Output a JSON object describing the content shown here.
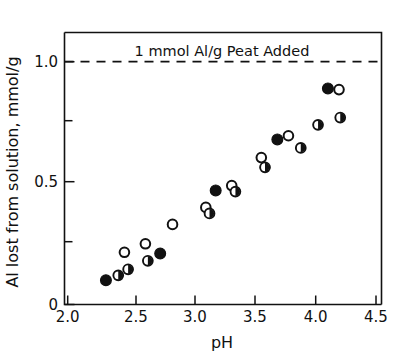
{
  "chart_data": {
    "type": "scatter",
    "title": "",
    "xlabel": "pH",
    "ylabel": "Al lost from solution, mmol/g",
    "xlim": [
      2.0,
      4.5
    ],
    "ylim": [
      0.0,
      1.08
    ],
    "grid": false,
    "legend": "none",
    "xticks": [
      "2.0",
      "2.5",
      "3.0",
      "3.5",
      "4.0",
      "4.5"
    ],
    "xtick_values": [
      2.0,
      2.5,
      3.0,
      3.5,
      4.0,
      4.5
    ],
    "yticks": [
      "0",
      "0.5",
      "1.0"
    ],
    "ytick_values": [
      0,
      0.5,
      1.0
    ],
    "yminor_values": [
      0.25,
      0.75
    ],
    "annotations": [
      {
        "text": "1 mmol Al/g Peat Added",
        "x": 3.25,
        "y": 1.0,
        "type": "reference-line-label"
      }
    ],
    "reference_lines": [
      {
        "orientation": "horizontal",
        "value": 1.0,
        "style": "dashed"
      }
    ],
    "series": [
      {
        "name": "filled-circle",
        "marker": "filled-circle",
        "points": [
          {
            "x": 2.31,
            "y": 0.1
          },
          {
            "x": 2.75,
            "y": 0.21
          },
          {
            "x": 3.2,
            "y": 0.47
          },
          {
            "x": 3.7,
            "y": 0.68
          },
          {
            "x": 4.11,
            "y": 0.89
          }
        ]
      },
      {
        "name": "open-circle",
        "marker": "open-circle",
        "points": [
          {
            "x": 2.46,
            "y": 0.215
          },
          {
            "x": 2.63,
            "y": 0.25
          },
          {
            "x": 2.85,
            "y": 0.33
          },
          {
            "x": 3.12,
            "y": 0.4
          },
          {
            "x": 3.33,
            "y": 0.49
          },
          {
            "x": 3.57,
            "y": 0.605
          },
          {
            "x": 3.79,
            "y": 0.695
          },
          {
            "x": 4.2,
            "y": 0.885
          }
        ]
      },
      {
        "name": "half-filled-circle",
        "marker": "half-filled-circle",
        "points": [
          {
            "x": 2.41,
            "y": 0.12
          },
          {
            "x": 2.49,
            "y": 0.145
          },
          {
            "x": 2.65,
            "y": 0.18
          },
          {
            "x": 3.15,
            "y": 0.375
          },
          {
            "x": 3.36,
            "y": 0.465
          },
          {
            "x": 3.6,
            "y": 0.565
          },
          {
            "x": 3.89,
            "y": 0.645
          },
          {
            "x": 4.03,
            "y": 0.74
          },
          {
            "x": 4.21,
            "y": 0.77
          }
        ]
      }
    ]
  },
  "axes": {
    "x_title": "pH",
    "y_title": "Al lost from solution, mmol/g"
  },
  "labels": {
    "x": [
      "2.0",
      "2.5",
      "3.0",
      "3.5",
      "4.0",
      "4.5"
    ],
    "y": [
      "1.0",
      "0.5",
      "0"
    ],
    "reference": "1 mmol Al/g Peat Added"
  }
}
